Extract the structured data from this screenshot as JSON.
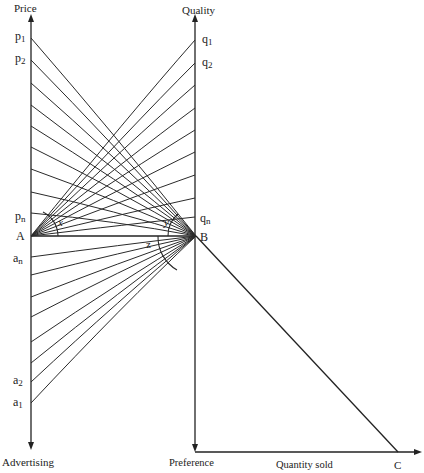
{
  "diagram": {
    "axes": {
      "left_top": "Price",
      "left_bottom": "Advertising",
      "right_top": "Quality",
      "bottom_left": "Preference",
      "bottom_middle": "Quantity sold"
    },
    "points": {
      "A": "A",
      "B": "B",
      "C": "C"
    },
    "angles": {
      "x": "x",
      "y": "y",
      "z": "z"
    },
    "price_ticks": {
      "p1": "p",
      "p1_sub": "1",
      "p2": "p",
      "p2_sub": "2",
      "pn": "p",
      "pn_sub": "n"
    },
    "quality_ticks": {
      "q1": "q",
      "q1_sub": "1",
      "q2": "q",
      "q2_sub": "2",
      "qn": "q",
      "qn_sub": "n"
    },
    "advertising_ticks": {
      "an": "a",
      "an_sub": "n",
      "a2": "a",
      "a2_sub": "2",
      "a1": "a",
      "a1_sub": "1"
    },
    "geometry": {
      "left_axis_x": 31,
      "right_axis_x": 195,
      "A_y": 236,
      "B_y": 236,
      "C_x": 398,
      "bottom_axis_y": 452,
      "price_tick_y": [
        38,
        60,
        83,
        105,
        126,
        147,
        169,
        192,
        213
      ],
      "quality_tick_y": [
        40,
        63,
        85,
        108,
        130,
        152,
        175,
        198,
        217
      ],
      "advertising_tick_y": [
        257,
        275,
        297,
        317,
        342,
        363,
        382,
        403
      ]
    },
    "colors": {
      "line": "#2a2a2a",
      "background": "#ffffff"
    }
  }
}
